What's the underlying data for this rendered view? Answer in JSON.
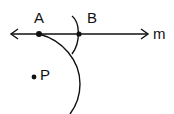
{
  "diagram": {
    "type": "geometric-construction",
    "line": {
      "label": "m",
      "y": 34,
      "x_start": 10,
      "x_end": 148,
      "arrows": "both"
    },
    "points": [
      {
        "name": "A",
        "x": 39,
        "y": 34,
        "label": "A"
      },
      {
        "name": "B",
        "x": 79,
        "y": 34,
        "label": "B"
      },
      {
        "name": "P",
        "x": 34,
        "y": 77,
        "label": "P"
      }
    ],
    "arcs": [
      {
        "name": "arc-from-p-through-a",
        "description": "large arc passing through A curving down to the bottom"
      },
      {
        "name": "arc-at-b",
        "description": "small arc crossing line m at B"
      }
    ],
    "colors": {
      "stroke": "#111111",
      "background": "#ffffff"
    }
  }
}
